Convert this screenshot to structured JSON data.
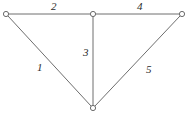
{
  "figure": {
    "name": "undirected-weighted-graph",
    "background_color": "#ffffff",
    "edge_color": "#6e6e6e",
    "vertex_stroke_color": "#6b6b6b",
    "vertex_fill_color": "#ffffff",
    "label_color": "#2b2b2b",
    "width": 187,
    "height": 115
  },
  "vertices": [
    {
      "id": "v-left",
      "x": 6,
      "y": 14,
      "radius": 2.6
    },
    {
      "id": "v-middle",
      "x": 93,
      "y": 14,
      "radius": 2.6
    },
    {
      "id": "v-right",
      "x": 182,
      "y": 14,
      "radius": 2.6
    },
    {
      "id": "v-bottom",
      "x": 93,
      "y": 108,
      "radius": 2.6
    }
  ],
  "edges": [
    {
      "id": "edge-1",
      "label": "1",
      "from": "v-left",
      "to": "v-bottom",
      "x1": 8,
      "y1": 16,
      "x2": 91,
      "y2": 106,
      "label_x": 37,
      "label_y": 62
    },
    {
      "id": "edge-2",
      "label": "2",
      "from": "v-left",
      "to": "v-middle",
      "x1": 9,
      "y1": 14,
      "x2": 90,
      "y2": 14,
      "label_x": 51,
      "label_y": 1
    },
    {
      "id": "edge-3",
      "label": "3",
      "from": "v-middle",
      "to": "v-bottom",
      "x1": 93,
      "y1": 17,
      "x2": 93,
      "y2": 105,
      "label_x": 83,
      "label_y": 47
    },
    {
      "id": "edge-4",
      "label": "4",
      "from": "v-middle",
      "to": "v-right",
      "x1": 96,
      "y1": 14,
      "x2": 179,
      "y2": 14,
      "label_x": 137,
      "label_y": 1
    },
    {
      "id": "edge-5",
      "label": "5",
      "from": "v-right",
      "to": "v-bottom",
      "x1": 180,
      "y1": 16,
      "x2": 95,
      "y2": 106,
      "label_x": 146,
      "label_y": 64
    }
  ],
  "chart_data": {
    "type": "diagram",
    "subtype": "graph",
    "title": "",
    "directed": false,
    "nodes": [
      "v-left",
      "v-middle",
      "v-right",
      "v-bottom"
    ],
    "edge_labels": [
      "1",
      "2",
      "3",
      "4",
      "5"
    ],
    "edge_list": [
      [
        "v-left",
        "v-bottom",
        "1"
      ],
      [
        "v-left",
        "v-middle",
        "2"
      ],
      [
        "v-middle",
        "v-bottom",
        "3"
      ],
      [
        "v-middle",
        "v-right",
        "4"
      ],
      [
        "v-right",
        "v-bottom",
        "5"
      ]
    ]
  }
}
